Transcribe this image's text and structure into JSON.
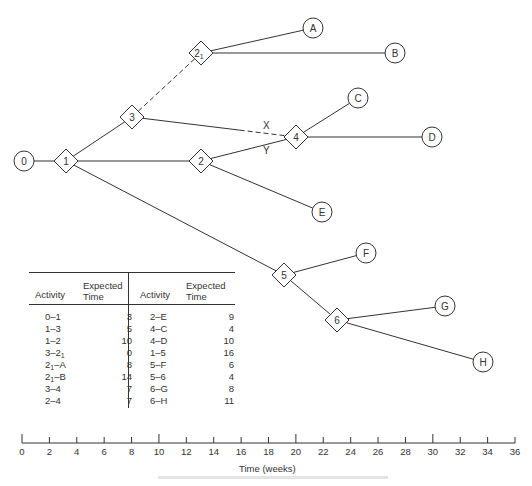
{
  "diagram": {
    "type": "PERT activity network on time scale",
    "nodes": [
      {
        "id": "0",
        "label": "0",
        "shape": "circle",
        "x": 24,
        "y": 161
      },
      {
        "id": "1",
        "label": "1",
        "shape": "diamond",
        "x": 66,
        "y": 161
      },
      {
        "id": "3",
        "label": "3",
        "shape": "diamond",
        "x": 132,
        "y": 117
      },
      {
        "id": "21",
        "label": "2",
        "sub": "1",
        "shape": "diamond",
        "x": 201,
        "y": 53
      },
      {
        "id": "2",
        "label": "2",
        "shape": "diamond",
        "x": 201,
        "y": 161
      },
      {
        "id": "4",
        "label": "4",
        "shape": "diamond",
        "x": 296,
        "y": 137
      },
      {
        "id": "5",
        "label": "5",
        "shape": "diamond",
        "x": 284,
        "y": 275
      },
      {
        "id": "6",
        "label": "6",
        "shape": "diamond",
        "x": 337,
        "y": 320
      },
      {
        "id": "A",
        "label": "A",
        "shape": "circle",
        "x": 313,
        "y": 28
      },
      {
        "id": "B",
        "label": "B",
        "shape": "circle",
        "x": 395,
        "y": 53
      },
      {
        "id": "C",
        "label": "C",
        "shape": "circle",
        "x": 358,
        "y": 98
      },
      {
        "id": "D",
        "label": "D",
        "shape": "circle",
        "x": 432,
        "y": 137
      },
      {
        "id": "E",
        "label": "E",
        "shape": "circle",
        "x": 322,
        "y": 212
      },
      {
        "id": "F",
        "label": "F",
        "shape": "circle",
        "x": 366,
        "y": 253
      },
      {
        "id": "G",
        "label": "G",
        "shape": "circle",
        "x": 445,
        "y": 306
      },
      {
        "id": "H",
        "label": "H",
        "shape": "circle",
        "x": 483,
        "y": 362
      }
    ],
    "edges": [
      {
        "from": "0",
        "to": "1",
        "style": "solid"
      },
      {
        "from": "1",
        "to": "3",
        "style": "solid"
      },
      {
        "from": "1",
        "to": "2",
        "style": "solid"
      },
      {
        "from": "1",
        "to": "5",
        "style": "solid"
      },
      {
        "from": "3",
        "to": "21",
        "style": "dashed"
      },
      {
        "from": "3",
        "to": "4",
        "style": "solid-then-dashed",
        "label": "X"
      },
      {
        "from": "2",
        "to": "4",
        "style": "solid",
        "label": "Y"
      },
      {
        "from": "21",
        "to": "A",
        "style": "solid"
      },
      {
        "from": "21",
        "to": "B",
        "style": "solid"
      },
      {
        "from": "2",
        "to": "E",
        "style": "solid"
      },
      {
        "from": "4",
        "to": "C",
        "style": "solid"
      },
      {
        "from": "4",
        "to": "D",
        "style": "solid"
      },
      {
        "from": "5",
        "to": "F",
        "style": "solid"
      },
      {
        "from": "5",
        "to": "6",
        "style": "solid"
      },
      {
        "from": "6",
        "to": "G",
        "style": "solid"
      },
      {
        "from": "6",
        "to": "H",
        "style": "solid"
      }
    ],
    "edge_labels": {
      "x": "X",
      "y": "Y"
    }
  },
  "table": {
    "headers": {
      "activity": "Activity",
      "expected_line1": "Expected",
      "expected_line2": "Time"
    },
    "left": [
      {
        "activity": "0–1",
        "time": "3"
      },
      {
        "activity": "1–3",
        "time": "5"
      },
      {
        "activity": "1–2",
        "time": "10"
      },
      {
        "activity": "3–2",
        "activity_sub": "1",
        "time": "0"
      },
      {
        "activity": "2",
        "activity_sub": "1",
        "activity_suffix": "–A",
        "time": "8"
      },
      {
        "activity": "2",
        "activity_sub": "1",
        "activity_suffix": "–B",
        "time": "14"
      },
      {
        "activity": "3–4",
        "time": "7"
      },
      {
        "activity": "2–4",
        "time": "7"
      }
    ],
    "right": [
      {
        "activity": "2–E",
        "time": "9"
      },
      {
        "activity": "4–C",
        "time": "4"
      },
      {
        "activity": "4–D",
        "time": "10"
      },
      {
        "activity": "1–5",
        "time": "16"
      },
      {
        "activity": "5–F",
        "time": "6"
      },
      {
        "activity": "5–6",
        "time": "4"
      },
      {
        "activity": "6–G",
        "time": "8"
      },
      {
        "activity": "6–H",
        "time": "11"
      }
    ]
  },
  "time_axis": {
    "title": "Time (weeks)",
    "min": 0,
    "max": 36,
    "step": 2,
    "ticks": [
      "0",
      "2",
      "4",
      "6",
      "8",
      "10",
      "12",
      "14",
      "16",
      "18",
      "20",
      "22",
      "24",
      "26",
      "28",
      "30",
      "32",
      "34",
      "36"
    ]
  }
}
